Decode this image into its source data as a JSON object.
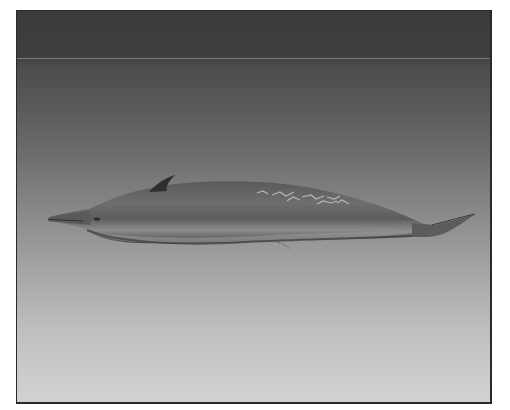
{
  "image": {
    "subject": "beaked whale illustration",
    "alt": "Side view of a gray beaked whale swimming left, with a small dorsal fin, pale scarring on its back, and a pointed tail fluke, against a dark-to-light gray gradient background",
    "colors": {
      "background_top": "#3b3b3b",
      "background_bottom": "#d1d1d1",
      "whale_body": "#6a6a6a",
      "whale_belly": "#9a9a9a",
      "dorsal_fin": "#2e2e2e",
      "scarring": "#c8c8c8",
      "frame_border": "#2a2a2a"
    }
  }
}
